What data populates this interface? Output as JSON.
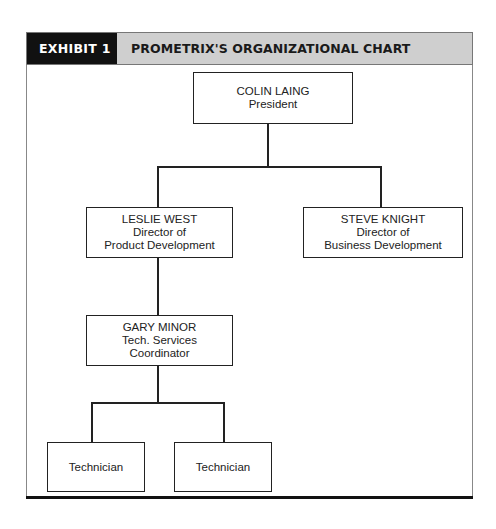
{
  "exhibit": {
    "tag": "EXHIBIT 1",
    "title": "PROMETRIX'S ORGANIZATIONAL CHART"
  },
  "org_chart": {
    "president": {
      "name": "COLIN LAING",
      "role_lines": [
        "President"
      ]
    },
    "product_dev": {
      "name": "LESLIE WEST",
      "role_lines": [
        "Director of",
        "Product Development"
      ]
    },
    "business_dev": {
      "name": "STEVE KNIGHT",
      "role_lines": [
        "Director of",
        "Business Development"
      ]
    },
    "tech_services": {
      "name": "GARY MINOR",
      "role_lines": [
        "Tech. Services",
        "Coordinator"
      ]
    },
    "technicians": [
      {
        "label": "Technician"
      },
      {
        "label": "Technician"
      }
    ]
  },
  "colors": {
    "tag_bg": "#111111",
    "title_bg": "#cfcfcf",
    "line": "#222222"
  }
}
